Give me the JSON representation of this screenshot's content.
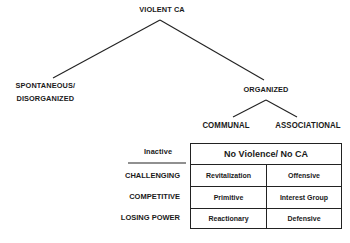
{
  "diagram": {
    "root": "VIOLENT CA",
    "branch_left": {
      "line1": "SPONTANEOUS/",
      "line2": "DISORGANIZED"
    },
    "branch_right": "ORGANIZED",
    "sub_left": "COMMUNAL",
    "sub_right": "ASSOCIATIONAL",
    "inactive_label": "Inactive",
    "table": {
      "header": "No Violence/ No CA",
      "rows": [
        {
          "label": "CHALLENGING",
          "communal": "Revitalization",
          "associational": "Offensive"
        },
        {
          "label": "COMPETITIVE",
          "communal": "Primitive",
          "associational": "Interest Group"
        },
        {
          "label": "LOSING POWER",
          "communal": "Reactionary",
          "associational": "Defensive"
        }
      ]
    },
    "line_color": "#222222"
  }
}
